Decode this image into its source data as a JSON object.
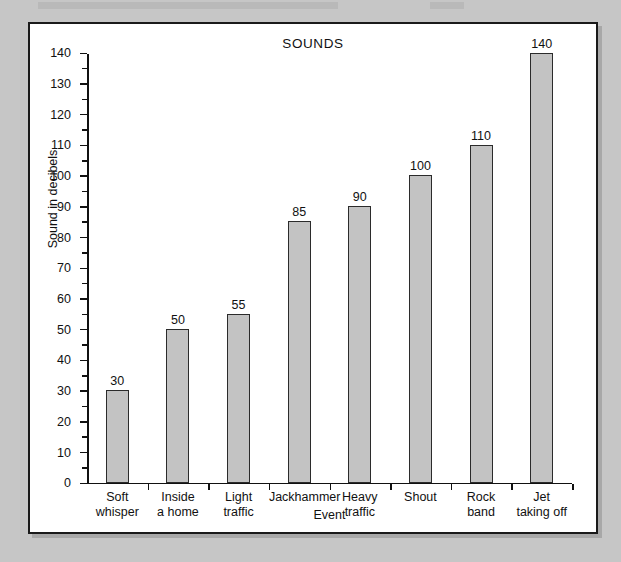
{
  "scan": {
    "header_note": ""
  },
  "chart_data": {
    "type": "bar",
    "title": "SOUNDS",
    "xlabel": "Event",
    "ylabel": "Sound in decibels",
    "ylim": [
      0,
      140
    ],
    "ytick_step": 10,
    "yminor_step": 5,
    "grid": false,
    "legend": null,
    "categories": [
      "Soft whisper",
      "Inside a home",
      "Light traffic",
      "Jackhammer",
      "Heavy traffic",
      "Shout",
      "Rock band",
      "Jet taking off"
    ],
    "category_lines": [
      [
        "Soft",
        "whisper"
      ],
      [
        "Inside",
        "a home"
      ],
      [
        "Light",
        "traffic"
      ],
      [
        "Jackhammer",
        ""
      ],
      [
        "Heavy",
        "traffic"
      ],
      [
        "Shout",
        ""
      ],
      [
        "Rock",
        "band"
      ],
      [
        "Jet",
        "taking off"
      ]
    ],
    "values": [
      30,
      50,
      55,
      85,
      90,
      100,
      110,
      140
    ],
    "value_labels": [
      "30",
      "50",
      "55",
      "85",
      "90",
      "100",
      "110",
      "140"
    ],
    "ytick_labels": [
      "0",
      "10",
      "20",
      "30",
      "40",
      "50",
      "60",
      "70",
      "80",
      "90",
      "100",
      "110",
      "120",
      "130",
      "140"
    ],
    "colors": {
      "bar_fill": "#c3c3c3",
      "bar_stroke": "#2b2b2b",
      "axis": "#111111",
      "page_background": "#c6c6c6",
      "plot_background": "#ffffff"
    }
  }
}
